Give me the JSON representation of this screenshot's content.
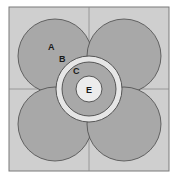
{
  "diagram": {
    "colors": {
      "frame_bg": "#cfcfcf",
      "petal_fill": "#a8a8a8",
      "ring_band": "#e6e6e6",
      "inner_disc": "#a8a8a8",
      "core": "#ececec",
      "stroke": "#4a4a4a"
    },
    "labels": {
      "A": "A",
      "B": "B",
      "C": "C",
      "E": "E"
    }
  }
}
